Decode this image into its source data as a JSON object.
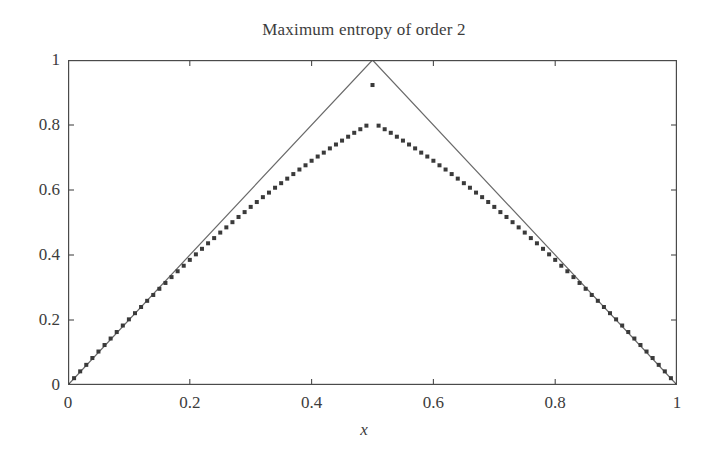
{
  "figure": {
    "background_color": "#ffffff",
    "text_color": "#3c3c3c"
  },
  "chart_data": {
    "type": "line",
    "title": "Maximum entropy of order 2",
    "xlabel": "x",
    "ylabel": "",
    "xlim": [
      0,
      1
    ],
    "ylim": [
      0,
      1
    ],
    "grid": false,
    "legend": null,
    "xticks": [
      0,
      0.2,
      0.4,
      0.6,
      0.8,
      1
    ],
    "xtick_labels": [
      "0",
      "0.2",
      "0.4",
      "0.6",
      "0.8",
      "1"
    ],
    "yticks": [
      0,
      0.2,
      0.4,
      0.6,
      0.8,
      1
    ],
    "ytick_labels": [
      "0",
      "0.2",
      "0.4",
      "0.6",
      "0.8",
      "1"
    ],
    "series": [
      {
        "name": "triangle-bound",
        "style": "line",
        "color": "#6a6a6a",
        "linewidth": 1,
        "x": [
          0,
          0.5,
          1
        ],
        "values": [
          0,
          1,
          0
        ]
      },
      {
        "name": "maximum-entropy-order-2",
        "style": "scatter",
        "marker": "square",
        "color": "#3a3a3a",
        "marker_size": 4,
        "x": [
          0,
          0.01,
          0.02,
          0.03,
          0.04,
          0.05,
          0.06,
          0.07,
          0.08,
          0.09,
          0.1,
          0.11,
          0.12,
          0.13,
          0.14,
          0.15,
          0.16,
          0.17,
          0.18,
          0.19,
          0.2,
          0.21,
          0.22,
          0.23,
          0.24,
          0.25,
          0.26,
          0.27,
          0.28,
          0.29,
          0.3,
          0.31,
          0.32,
          0.33,
          0.34,
          0.35,
          0.36,
          0.37,
          0.38,
          0.39,
          0.4,
          0.41,
          0.42,
          0.43,
          0.44,
          0.45,
          0.46,
          0.47,
          0.48,
          0.49,
          0.5,
          0.51,
          0.52,
          0.53,
          0.54,
          0.55,
          0.56,
          0.57,
          0.58,
          0.59,
          0.6,
          0.61,
          0.62,
          0.63,
          0.64,
          0.65,
          0.66,
          0.67,
          0.68,
          0.69,
          0.7,
          0.71,
          0.72,
          0.73,
          0.74,
          0.75,
          0.76,
          0.77,
          0.78,
          0.79,
          0.8,
          0.81,
          0.82,
          0.83,
          0.84,
          0.85,
          0.86,
          0.87,
          0.88,
          0.89,
          0.9,
          0.91,
          0.92,
          0.93,
          0.94,
          0.95,
          0.96,
          0.97,
          0.98,
          0.99,
          1
        ],
        "values": [
          0.0,
          0.021,
          0.042,
          0.062,
          0.083,
          0.103,
          0.123,
          0.143,
          0.163,
          0.183,
          0.202,
          0.221,
          0.24,
          0.259,
          0.277,
          0.296,
          0.314,
          0.332,
          0.35,
          0.367,
          0.385,
          0.402,
          0.419,
          0.436,
          0.452,
          0.469,
          0.485,
          0.501,
          0.517,
          0.532,
          0.548,
          0.563,
          0.578,
          0.592,
          0.607,
          0.621,
          0.635,
          0.649,
          0.663,
          0.676,
          0.69,
          0.703,
          0.715,
          0.728,
          0.74,
          0.752,
          0.764,
          0.776,
          0.787,
          0.798,
          0.923,
          0.798,
          0.787,
          0.776,
          0.764,
          0.752,
          0.74,
          0.728,
          0.715,
          0.703,
          0.69,
          0.676,
          0.663,
          0.649,
          0.635,
          0.621,
          0.607,
          0.592,
          0.578,
          0.563,
          0.548,
          0.532,
          0.517,
          0.501,
          0.485,
          0.469,
          0.452,
          0.436,
          0.419,
          0.402,
          0.385,
          0.367,
          0.35,
          0.332,
          0.314,
          0.296,
          0.277,
          0.259,
          0.24,
          0.221,
          0.202,
          0.183,
          0.163,
          0.143,
          0.123,
          0.103,
          0.083,
          0.062,
          0.042,
          0.021,
          0.0
        ],
        "peak_value": 0.923,
        "peak_x": 0.5
      }
    ]
  }
}
